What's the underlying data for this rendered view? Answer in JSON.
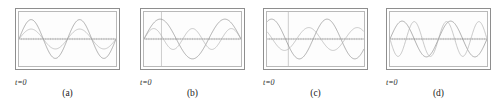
{
  "figure": {
    "background_color": "#ffffff",
    "frame_color": "#8e8e8e",
    "inner_frame_color": "#b9b9b9",
    "axis_color": "#6f6f6f",
    "cursor_color": "#9a9a9a",
    "wave_primary_color": "#8c8c8c",
    "wave_secondary_color": "#b0b0b0"
  },
  "panels": [
    {
      "id": "panel-a",
      "caption": "(a)",
      "t_zero_label": "t=0",
      "has_cursor": false,
      "cursor_x_frac": 0.0,
      "chart_data": {
        "type": "line",
        "title": "(a)",
        "xlabel": "t",
        "ylabel": "",
        "xlim": [
          0,
          1
        ],
        "ylim": [
          -1,
          1
        ],
        "grid": false,
        "legend": "none",
        "annotations": [
          "t=0"
        ],
        "series": [
          {
            "name": "wave-large",
            "amplitude": 0.78,
            "cycles": 2.0,
            "phase_deg": 0,
            "color": "#8c8c8c"
          },
          {
            "name": "wave-small",
            "amplitude": 0.4,
            "cycles": 2.0,
            "phase_deg": 0,
            "color": "#b0b0b0"
          }
        ]
      }
    },
    {
      "id": "panel-b",
      "caption": "(b)",
      "t_zero_label": "t=0",
      "has_cursor": true,
      "cursor_x_frac": 0.18,
      "chart_data": {
        "type": "line",
        "title": "(b)",
        "xlabel": "t",
        "ylabel": "",
        "xlim": [
          0,
          1
        ],
        "ylim": [
          -1,
          1
        ],
        "grid": false,
        "legend": "none",
        "annotations": [
          "t=0"
        ],
        "series": [
          {
            "name": "wave-large",
            "amplitude": 0.8,
            "cycles": 1.5,
            "phase_deg": 0,
            "color": "#8c8c8c"
          },
          {
            "name": "wave-small",
            "amplitude": 0.42,
            "cycles": 2.5,
            "phase_deg": 0,
            "color": "#b0b0b0"
          }
        ]
      }
    },
    {
      "id": "panel-c",
      "caption": "(c)",
      "t_zero_label": "t=0",
      "has_cursor": true,
      "cursor_x_frac": 0.22,
      "chart_data": {
        "type": "line",
        "title": "(c)",
        "xlabel": "t",
        "ylabel": "",
        "xlim": [
          0,
          1
        ],
        "ylim": [
          -1,
          1
        ],
        "grid": false,
        "legend": "none",
        "annotations": [
          "t=0"
        ],
        "series": [
          {
            "name": "wave-large",
            "amplitude": 0.8,
            "cycles": 1.75,
            "phase_deg": 60,
            "color": "#8c8c8c"
          },
          {
            "name": "wave-small",
            "amplitude": 0.46,
            "cycles": 2.0,
            "phase_deg": 140,
            "color": "#b0b0b0"
          }
        ]
      }
    },
    {
      "id": "panel-d",
      "caption": "(d)",
      "t_zero_label": "t=0",
      "has_cursor": false,
      "cursor_x_frac": 0.0,
      "chart_data": {
        "type": "line",
        "title": "(d)",
        "xlabel": "t",
        "ylabel": "",
        "xlim": [
          0,
          1
        ],
        "ylim": [
          -1,
          1
        ],
        "grid": false,
        "legend": "none",
        "annotations": [
          "t=0"
        ],
        "series": [
          {
            "name": "wave-low-freq",
            "amplitude": 0.72,
            "cycles": 2.0,
            "phase_deg": 0,
            "color": "#8c8c8c"
          },
          {
            "name": "wave-high-freq",
            "amplitude": 0.7,
            "cycles": 3.0,
            "phase_deg": 180,
            "color": "#b0b0b0"
          }
        ]
      }
    }
  ]
}
